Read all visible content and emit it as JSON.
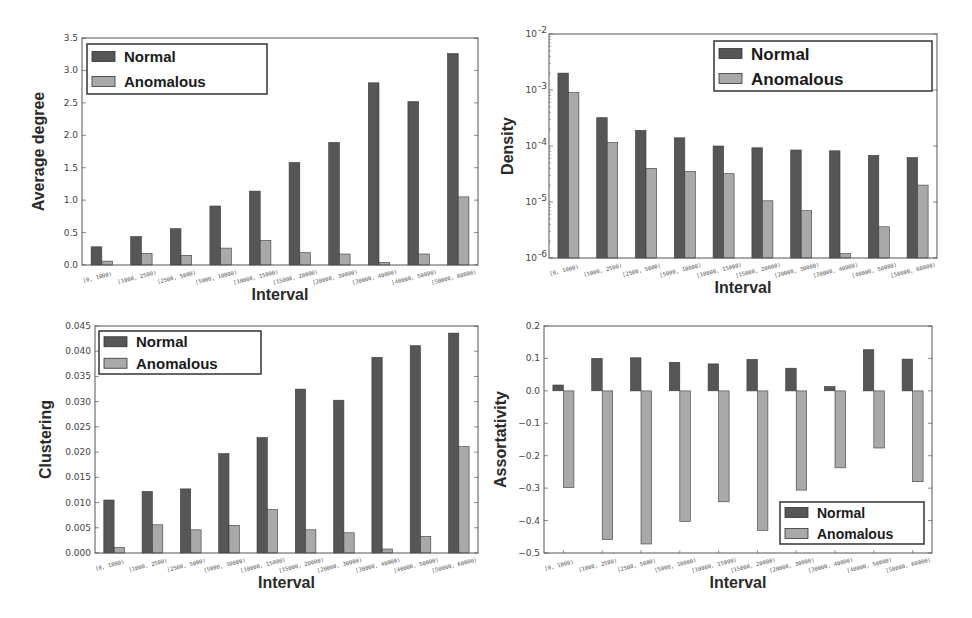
{
  "colors": {
    "normal": "#565656",
    "anomalous": "#a9a9a9",
    "frame": "#555555",
    "legend_border": "#333333"
  },
  "legend": {
    "normal": "Normal",
    "anomalous": "Anomalous"
  },
  "chart_data": [
    {
      "id": "avg-degree",
      "type": "bar",
      "title": "",
      "xlabel": "Interval",
      "ylabel": "Average degree",
      "yscale": "linear",
      "ylim": [
        0,
        3.5
      ],
      "yticks": [
        0.0,
        0.5,
        1.0,
        1.5,
        2.0,
        2.5,
        3.0,
        3.5
      ],
      "ytick_labels": [
        "0.0",
        "0.5",
        "1.0",
        "1.5",
        "2.0",
        "2.5",
        "3.0",
        "3.5"
      ],
      "legend_position": "upper left",
      "categories": [
        "[0, 1000)",
        "[1000, 2500)",
        "[2500, 5000)",
        "[5000, 10000)",
        "[10000, 15000)",
        "[15000, 20000)",
        "[20000, 30000)",
        "[30000, 40000)",
        "[40000, 50000)",
        "[50000, 60000)"
      ],
      "series": [
        {
          "name": "Normal",
          "values": [
            0.28,
            0.44,
            0.56,
            0.91,
            1.14,
            1.58,
            1.89,
            2.81,
            2.52,
            3.26
          ]
        },
        {
          "name": "Anomalous",
          "values": [
            0.06,
            0.18,
            0.15,
            0.26,
            0.38,
            0.19,
            0.17,
            0.04,
            0.17,
            1.05
          ]
        }
      ],
      "box": {
        "x0": 82,
        "y0": 38,
        "x1": 478,
        "y1": 265
      },
      "legend_box": {
        "x": 87,
        "y": 44,
        "w": 180,
        "h": 50,
        "font": 15
      }
    },
    {
      "id": "density",
      "type": "bar",
      "title": "",
      "xlabel": "Interval",
      "ylabel": "Density",
      "yscale": "log",
      "ylim": [
        1e-06,
        0.01
      ],
      "yticks": [
        1e-06,
        1e-05,
        0.0001,
        0.001,
        0.01
      ],
      "ytick_labels": [
        "10",
        "10",
        "10",
        "10",
        "10"
      ],
      "ytick_exponents": [
        "-6",
        "-5",
        "-4",
        "-3",
        "-2"
      ],
      "legend_position": "upper right",
      "categories": [
        "[0, 1000)",
        "[1000, 2500)",
        "[2500, 5000)",
        "[5000, 10000)",
        "[10000, 15000)",
        "[15000, 20000)",
        "[20000, 30000)",
        "[30000, 40000)",
        "[40000, 50000)",
        "[50000, 60000)"
      ],
      "series": [
        {
          "name": "Normal",
          "values": [
            0.002,
            0.00032,
            0.00019,
            0.00014,
            0.0001,
            9.3e-05,
            8.5e-05,
            8.2e-05,
            6.8e-05,
            6.2e-05
          ]
        },
        {
          "name": "Anomalous",
          "values": [
            0.0009,
            0.000115,
            4e-05,
            3.5e-05,
            3.2e-05,
            1.05e-05,
            7e-06,
            1.2e-06,
            3.6e-06,
            2e-05
          ]
        }
      ],
      "box": {
        "x0": 549,
        "y0": 34,
        "x1": 937,
        "y1": 258
      },
      "legend_box": {
        "x": 714,
        "y": 41,
        "w": 218,
        "h": 50,
        "font": 17
      }
    },
    {
      "id": "clustering",
      "type": "bar",
      "title": "",
      "xlabel": "Interval",
      "ylabel": "Clustering",
      "yscale": "linear",
      "ylim": [
        0,
        0.045
      ],
      "yticks": [
        0.0,
        0.005,
        0.01,
        0.015,
        0.02,
        0.025,
        0.03,
        0.035,
        0.04,
        0.045
      ],
      "ytick_labels": [
        "0.000",
        "0.005",
        "0.010",
        "0.015",
        "0.020",
        "0.025",
        "0.030",
        "0.035",
        "0.040",
        "0.045"
      ],
      "legend_position": "upper left",
      "categories": [
        "[0, 1000)",
        "[1000, 2500)",
        "[2500, 5000)",
        "[5000, 10000)",
        "[10000, 15000)",
        "[15000, 20000)",
        "[20000, 30000)",
        "[30000, 40000)",
        "[40000, 50000)",
        "[50000, 60000)"
      ],
      "series": [
        {
          "name": "Normal",
          "values": [
            0.0105,
            0.0122,
            0.0127,
            0.0197,
            0.0229,
            0.0325,
            0.0303,
            0.0388,
            0.0411,
            0.0436
          ]
        },
        {
          "name": "Anomalous",
          "values": [
            0.0011,
            0.0056,
            0.0046,
            0.0055,
            0.0086,
            0.0046,
            0.004,
            0.0008,
            0.0033,
            0.0211
          ]
        }
      ],
      "box": {
        "x0": 95,
        "y0": 326,
        "x1": 478,
        "y1": 553
      },
      "legend_box": {
        "x": 99,
        "y": 331,
        "w": 162,
        "h": 43,
        "font": 15
      }
    },
    {
      "id": "assortativity",
      "type": "bar",
      "title": "",
      "xlabel": "Interval",
      "ylabel": "Assortativity",
      "yscale": "linear",
      "ylim": [
        -0.5,
        0.2
      ],
      "yticks": [
        -0.5,
        -0.4,
        -0.3,
        -0.2,
        -0.1,
        0.0,
        0.1,
        0.2
      ],
      "ytick_labels": [
        "−0.5",
        "−0.4",
        "−0.3",
        "−0.2",
        "−0.1",
        "0.0",
        "0.1",
        "0.2"
      ],
      "legend_position": "lower right",
      "categories": [
        "[0, 1000)",
        "[1000, 2500)",
        "[2500, 5000)",
        "[5000, 10000)",
        "[10000, 15000)",
        "[15000, 20000)",
        "[20000, 30000)",
        "[30000, 40000)",
        "[40000, 50000)",
        "[50000, 60000)"
      ],
      "series": [
        {
          "name": "Normal",
          "values": [
            0.018,
            0.1,
            0.102,
            0.088,
            0.083,
            0.097,
            0.07,
            0.013,
            0.127,
            0.098
          ]
        },
        {
          "name": "Anomalous",
          "values": [
            -0.298,
            -0.458,
            -0.472,
            -0.403,
            -0.342,
            -0.43,
            -0.306,
            -0.237,
            -0.176,
            -0.28
          ]
        }
      ],
      "box": {
        "x0": 544,
        "y0": 326,
        "x1": 932,
        "y1": 553
      },
      "legend_box": {
        "x": 780,
        "y": 502,
        "w": 144,
        "h": 42,
        "font": 14
      }
    }
  ]
}
